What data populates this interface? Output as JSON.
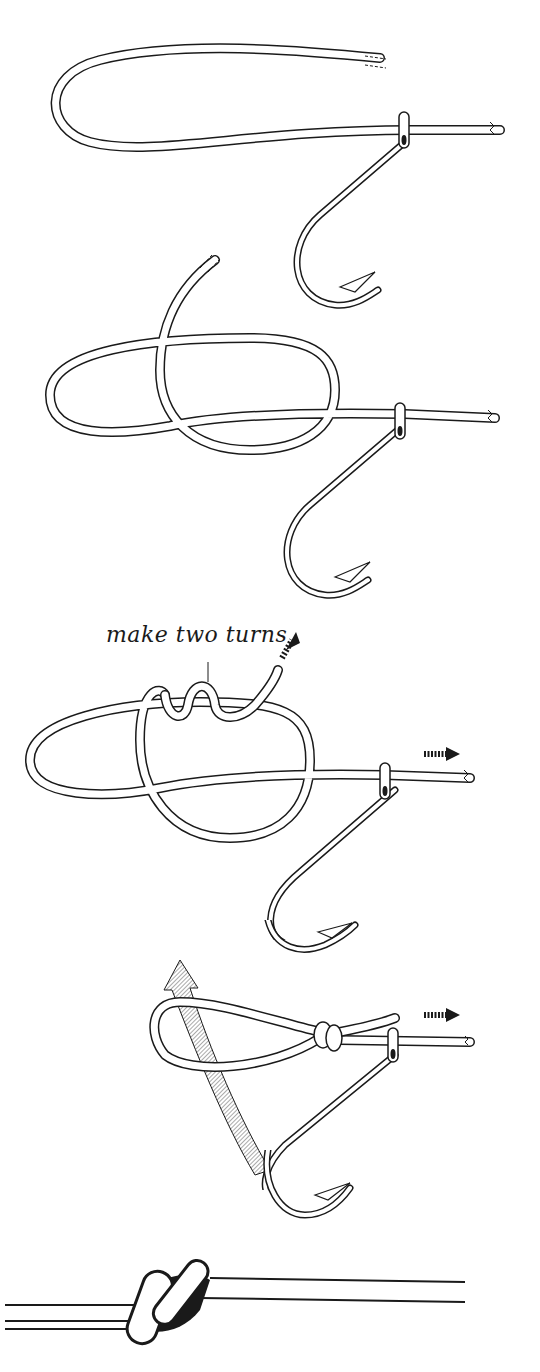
{
  "diagram": {
    "colors": {
      "line": "#1a1a1a",
      "background": "#ffffff",
      "hatch": "#555555"
    },
    "steps": [
      {
        "index": 1,
        "name": "pass-line-through-eye",
        "elements": [
          "line-loop",
          "hook",
          "eye",
          "line-tag-end"
        ]
      },
      {
        "index": 2,
        "name": "form-loop-crossing",
        "elements": [
          "line-loop",
          "crossing-turn",
          "hook",
          "eye"
        ]
      },
      {
        "index": 3,
        "name": "make-two-turns",
        "label": "make two turns",
        "elements": [
          "line-loop",
          "two-turns",
          "pull-arrow-up",
          "pull-arrow-right",
          "hook",
          "eye"
        ]
      },
      {
        "index": 4,
        "name": "tighten-and-swing-loop",
        "elements": [
          "knot",
          "loop",
          "hatched-swing-arrow",
          "pull-arrow-right",
          "hook",
          "eye"
        ]
      },
      {
        "index": 5,
        "name": "finished-knot",
        "elements": [
          "finished-knot",
          "standing-line",
          "tag-lines"
        ]
      }
    ]
  }
}
